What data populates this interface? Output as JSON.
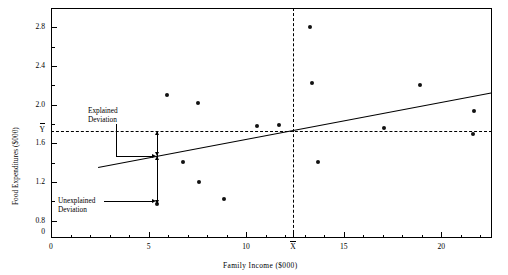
{
  "chart_data": {
    "type": "scatter",
    "title": "",
    "xlabel": "Family Income ($000)",
    "ylabel": "Food Expenditures ($000)",
    "xlim": [
      0,
      22.6
    ],
    "ylim": [
      0.62,
      3.0
    ],
    "grid": false,
    "legend": "none",
    "x_ticks": [
      0,
      5,
      10,
      15,
      20
    ],
    "x_tick_labels": [
      "0",
      "5",
      "10",
      "15",
      "20"
    ],
    "x_minor_ticks": [
      1,
      2,
      3,
      4,
      6,
      7,
      8,
      9,
      11,
      12,
      13,
      14,
      16,
      17,
      18,
      19,
      21,
      22
    ],
    "y_ticks": [
      0.8,
      1.2,
      1.6,
      2.0,
      2.4,
      2.8
    ],
    "y_tick_labels": [
      "0.8",
      "1.2",
      "1.6",
      "2.0",
      "2.4",
      "2.8"
    ],
    "y_minor_ticks": [
      1.0,
      1.4,
      1.8,
      2.2,
      2.6
    ],
    "y_origin_label": "0",
    "x_mean": 12.4,
    "x_mean_label": "X",
    "y_mean": 1.73,
    "y_mean_label": "Y",
    "points": [
      {
        "x": 5.45,
        "y": 0.97
      },
      {
        "x": 5.95,
        "y": 2.1
      },
      {
        "x": 6.75,
        "y": 1.41
      },
      {
        "x": 7.55,
        "y": 2.02
      },
      {
        "x": 7.6,
        "y": 1.2
      },
      {
        "x": 8.85,
        "y": 1.02
      },
      {
        "x": 10.55,
        "y": 1.78
      },
      {
        "x": 11.7,
        "y": 1.79
      },
      {
        "x": 13.25,
        "y": 2.8
      },
      {
        "x": 13.35,
        "y": 2.22
      },
      {
        "x": 13.7,
        "y": 1.41
      },
      {
        "x": 17.05,
        "y": 1.76
      },
      {
        "x": 18.9,
        "y": 2.2
      },
      {
        "x": 21.7,
        "y": 1.93
      },
      {
        "x": 21.6,
        "y": 1.7
      }
    ],
    "regression_line": {
      "x0": 2.4,
      "y0": 1.352,
      "x1": 22.55,
      "y1": 2.122
    },
    "deviation_x": 5.45,
    "deviation_point_y": 0.97,
    "deviation_fitted_y": 1.47,
    "annotations": [
      {
        "name": "explained-deviation",
        "line1": "Explained",
        "line2": "Deviation"
      },
      {
        "name": "unexplained-deviation",
        "line1": "Unexplained",
        "line2": "Deviation"
      }
    ]
  }
}
